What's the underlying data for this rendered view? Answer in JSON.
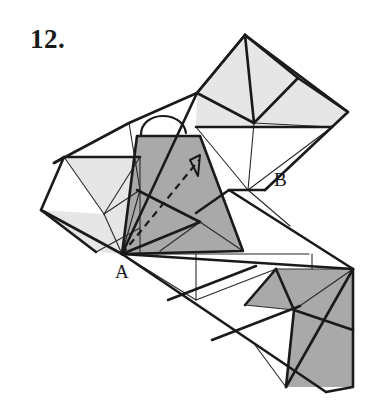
{
  "figure": {
    "problem_number": "12.",
    "type": "geometric-net-diagram",
    "vertex_labels": [
      {
        "id": "A",
        "text": "A",
        "x": 120,
        "y": 272
      },
      {
        "id": "B",
        "text": "B",
        "x": 279,
        "y": 180
      }
    ],
    "colors": {
      "background": "#ffffff",
      "stroke": "#1a1a1a",
      "thin_stroke": "#2a2a2a",
      "light_fill": "#e6e6e6",
      "dark_fill": "#a9a9a9",
      "white_fill": "#ffffff",
      "label_color": "#1a1a1a"
    },
    "stroke_widths": {
      "outline": 2.6,
      "crease": 1.5,
      "thin": 1.1,
      "dashed": 2.0
    },
    "shapes": {
      "light_faces": [
        {
          "name": "top-pyramid-left-face",
          "points": "245,35 198,92 253,122 276,108"
        },
        {
          "name": "top-pyramid-right-face",
          "points": "245,35 300,78 331,125 276,108 253,122"
        },
        {
          "name": "top-pyramid-base-face",
          "points": "198,92 253,122 276,108 331,125 196,125"
        },
        {
          "name": "top-right-wing",
          "points": "300,78 349,113 331,125"
        },
        {
          "name": "left-wing-upper",
          "points": "64,157 141,157 141,190 108,212"
        },
        {
          "name": "left-wing-lower",
          "points": "41,210 108,212 141,190 141,235 122,253"
        },
        {
          "name": "left-wing-fan",
          "points": "108,212 141,190 141,253 122,253"
        }
      ],
      "dark_faces": [
        {
          "name": "center-tall-face",
          "points": "137,135 200,135 244,249 137,249"
        },
        {
          "name": "center-lower-left-face",
          "points": "122,253 137,190 200,222 160,249"
        },
        {
          "name": "bottom-right-face-upper",
          "points": "276,268 352,268 352,330 300,312"
        },
        {
          "name": "bottom-right-face-lower",
          "points": "300,312 352,330 352,386 285,386"
        }
      ]
    },
    "annotations": {
      "dashed_arrow": {
        "name": "fold-path-arrow",
        "from": "A",
        "to": "upper-right-of-center-face",
        "style": "dashed with arrowhead"
      },
      "arc": {
        "name": "fold-rotation-arc",
        "position": "above center dark face"
      }
    }
  }
}
